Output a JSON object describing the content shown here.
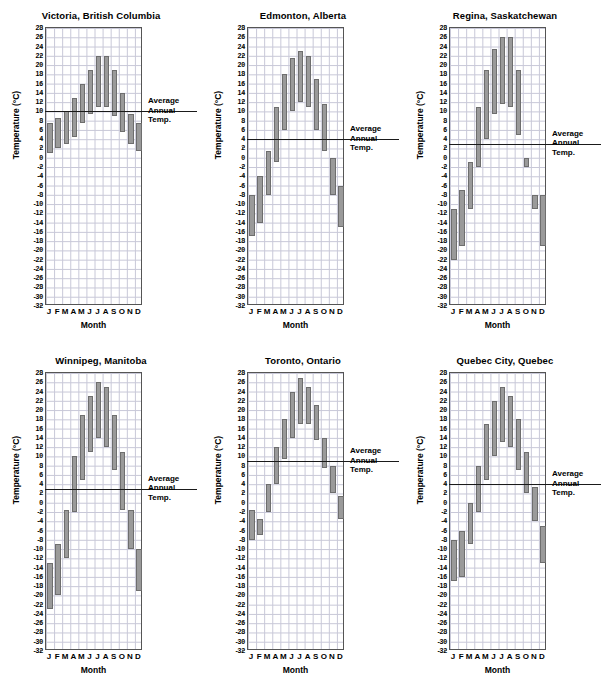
{
  "figure": {
    "panel_count": 6,
    "axis": {
      "ylabel": "Temperature (°C)",
      "xlabel": "Month",
      "ymin": -32,
      "ymax": 28,
      "ystep": 2,
      "ytick_labels": [
        "28",
        "26",
        "24",
        "22",
        "20",
        "18",
        "16",
        "14",
        "12",
        "10",
        "8",
        "6",
        "4",
        "2",
        "0",
        "-2",
        "-4",
        "-6",
        "-8",
        "-10",
        "-12",
        "-14",
        "-16",
        "-18",
        "-20",
        "-22",
        "-24",
        "-26",
        "-28",
        "-30",
        "-32"
      ],
      "xtick_labels": [
        "J",
        "F",
        "M",
        "A",
        "M",
        "J",
        "J",
        "A",
        "S",
        "O",
        "N",
        "D"
      ]
    },
    "avg_annotation": {
      "line1": "Average",
      "line2": "Annual",
      "line3": "Temp."
    },
    "colors": {
      "bar_fill": "#9a9a9a",
      "bar_stroke": "#6e6e6e",
      "grid": "#c8c8d8",
      "axis": "#555555",
      "avg_line": "#1a1a1a",
      "background": "#ffffff"
    }
  },
  "chart_data": [
    {
      "type": "bar",
      "subtype": "floating-range-bar",
      "title": "Victoria, British Columbia",
      "xlabel": "Month",
      "ylabel": "Temperature (°C)",
      "ylim": [
        -32,
        28
      ],
      "ystep": 2,
      "grid": true,
      "categories": [
        "J",
        "F",
        "M",
        "A",
        "M",
        "J",
        "J",
        "A",
        "S",
        "O",
        "N",
        "D"
      ],
      "series": [
        {
          "name": "Daily minimum temperature",
          "values": [
            1,
            2,
            3,
            4.5,
            7.5,
            9.5,
            11,
            11,
            9,
            5.5,
            3,
            1.5
          ]
        },
        {
          "name": "Daily maximum temperature",
          "values": [
            7.5,
            8.5,
            10,
            13,
            16,
            19,
            22,
            22,
            19,
            14,
            9.5,
            7.5
          ]
        }
      ],
      "average_annual_temp": 10,
      "annotation": "Average Annual Temp."
    },
    {
      "type": "bar",
      "subtype": "floating-range-bar",
      "title": "Edmonton, Alberta",
      "xlabel": "Month",
      "ylabel": "Temperature (°C)",
      "ylim": [
        -32,
        28
      ],
      "ystep": 2,
      "grid": true,
      "categories": [
        "J",
        "F",
        "M",
        "A",
        "M",
        "J",
        "J",
        "A",
        "S",
        "O",
        "N",
        "D"
      ],
      "series": [
        {
          "name": "Daily minimum temperature",
          "values": [
            -17,
            -14,
            -8,
            -1,
            6,
            10,
            12,
            11,
            6,
            1.5,
            -8,
            -15
          ]
        },
        {
          "name": "Daily maximum temperature",
          "values": [
            -8,
            -4,
            1.5,
            11,
            18,
            21.5,
            23,
            22,
            17,
            11.5,
            0,
            -6
          ]
        }
      ],
      "average_annual_temp": 4,
      "annotation": "Average Annual Temp."
    },
    {
      "type": "bar",
      "subtype": "floating-range-bar",
      "title": "Regina, Saskatchewan",
      "xlabel": "Month",
      "ylabel": "Temperature (°C)",
      "ylim": [
        -32,
        28
      ],
      "ystep": 2,
      "grid": true,
      "categories": [
        "J",
        "F",
        "M",
        "A",
        "M",
        "J",
        "J",
        "A",
        "S",
        "O",
        "N",
        "D"
      ],
      "series": [
        {
          "name": "Daily minimum temperature",
          "values": [
            -22,
            -19,
            -11,
            -2,
            4,
            9.5,
            11.5,
            11,
            5,
            -2,
            -11,
            -19
          ]
        },
        {
          "name": "Daily maximum temperature",
          "values": [
            -11,
            -7,
            -1,
            11,
            19,
            23.5,
            26,
            26,
            19,
            0,
            -8,
            -8
          ]
        }
      ],
      "average_annual_temp": 3,
      "annotation": "Average Annual Temp."
    },
    {
      "type": "bar",
      "subtype": "floating-range-bar",
      "title": "Winnipeg, Manitoba",
      "xlabel": "Month",
      "ylabel": "Temperature (°C)",
      "ylim": [
        -32,
        28
      ],
      "ystep": 2,
      "grid": true,
      "categories": [
        "J",
        "F",
        "M",
        "A",
        "M",
        "J",
        "J",
        "A",
        "S",
        "O",
        "N",
        "D"
      ],
      "series": [
        {
          "name": "Daily minimum temperature",
          "values": [
            -23,
            -20,
            -12,
            -2,
            5,
            11,
            14,
            12,
            7,
            -1.5,
            -10,
            -19
          ]
        },
        {
          "name": "Daily maximum temperature",
          "values": [
            -13,
            -9,
            -1.5,
            10,
            19,
            23,
            26,
            25,
            19,
            11,
            -1.5,
            -10
          ]
        }
      ],
      "average_annual_temp": 3,
      "annotation": "Average Annual Temp."
    },
    {
      "type": "bar",
      "subtype": "floating-range-bar",
      "title": "Toronto, Ontario",
      "xlabel": "Month",
      "ylabel": "Temperature (°C)",
      "ylim": [
        -32,
        28
      ],
      "ystep": 2,
      "grid": true,
      "categories": [
        "J",
        "F",
        "M",
        "A",
        "M",
        "J",
        "J",
        "A",
        "S",
        "O",
        "N",
        "D"
      ],
      "series": [
        {
          "name": "Daily minimum temperature",
          "values": [
            -8,
            -7,
            -2,
            4,
            9.5,
            14,
            17,
            17,
            13.5,
            7.5,
            2,
            -3.5
          ]
        },
        {
          "name": "Daily maximum temperature",
          "values": [
            -1.5,
            -3.5,
            4,
            12,
            18,
            24,
            27,
            25,
            21,
            14,
            8,
            1.5
          ]
        }
      ],
      "average_annual_temp": 9,
      "annotation": "Average Annual Temp."
    },
    {
      "type": "bar",
      "subtype": "floating-range-bar",
      "title": "Quebec City, Quebec",
      "xlabel": "Month",
      "ylabel": "Temperature (°C)",
      "ylim": [
        -32,
        28
      ],
      "ystep": 2,
      "grid": true,
      "categories": [
        "J",
        "F",
        "M",
        "A",
        "M",
        "J",
        "J",
        "A",
        "S",
        "O",
        "N",
        "D"
      ],
      "series": [
        {
          "name": "Daily minimum temperature",
          "values": [
            -17,
            -16,
            -9,
            -2,
            5,
            10,
            13,
            12,
            7,
            2,
            -4,
            -13
          ]
        },
        {
          "name": "Daily maximum temperature",
          "values": [
            -8,
            -6,
            0,
            8,
            17,
            22,
            25,
            23,
            18,
            11,
            3.5,
            -5
          ]
        }
      ],
      "average_annual_temp": 4,
      "annotation": "Average Annual Temp."
    }
  ]
}
